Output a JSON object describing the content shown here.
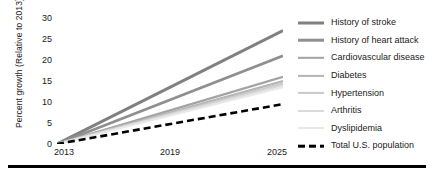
{
  "chart_data": {
    "type": "line",
    "title": "",
    "xlabel": "",
    "ylabel": "Percent growth (Relative to 2013)",
    "x": [
      2013,
      2025
    ],
    "xlim": [
      2013,
      2025
    ],
    "ylim": [
      0,
      30
    ],
    "xticks": [
      "2013",
      "2019",
      "2025"
    ],
    "xtick_values": [
      2013,
      2019,
      2025
    ],
    "yticks": [
      "0",
      "5",
      "10",
      "15",
      "20",
      "25",
      "30"
    ],
    "ytick_values": [
      0,
      5,
      10,
      15,
      20,
      25,
      30
    ],
    "grid": false,
    "legend_position": "right",
    "series": [
      {
        "name": "History of stroke",
        "values": [
          0,
          27.0
        ],
        "color": "#808080",
        "style": "solid",
        "width": 3.0
      },
      {
        "name": "History of heart attack",
        "values": [
          0,
          21.0
        ],
        "color": "#8f8f8f",
        "style": "solid",
        "width": 2.6
      },
      {
        "name": "Cardiovascular disease",
        "values": [
          0,
          16.0
        ],
        "color": "#a3a3a3",
        "style": "solid",
        "width": 2.4
      },
      {
        "name": "Diabetes",
        "values": [
          0,
          15.0
        ],
        "color": "#b5b5b5",
        "style": "solid",
        "width": 2.2
      },
      {
        "name": "Hypertension",
        "values": [
          0,
          14.4
        ],
        "color": "#c9c9c9",
        "style": "solid",
        "width": 2.2
      },
      {
        "name": "Arthritis",
        "values": [
          0,
          14.0
        ],
        "color": "#dadada",
        "style": "solid",
        "width": 2.0
      },
      {
        "name": "Dyslipidemia",
        "values": [
          0,
          13.5
        ],
        "color": "#e8e8e8",
        "style": "solid",
        "width": 2.0
      },
      {
        "name": "Total U.S. population",
        "values": [
          0,
          9.5
        ],
        "color": "#000000",
        "style": "dashed",
        "width": 2.6
      }
    ]
  },
  "legend": {
    "items": [
      {
        "label": "History of stroke"
      },
      {
        "label": "History of heart attack"
      },
      {
        "label": "Cardiovascular disease"
      },
      {
        "label": "Diabetes"
      },
      {
        "label": "Hypertension"
      },
      {
        "label": "Arthritis"
      },
      {
        "label": "Dyslipidemia"
      },
      {
        "label": "Total U.S. population"
      }
    ]
  }
}
